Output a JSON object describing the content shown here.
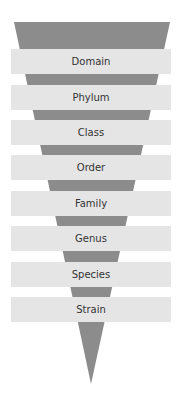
{
  "diagram": {
    "type": "taxonomy-funnel",
    "colors": {
      "funnel": "#8c8c8c",
      "bar": "#e5e5e5",
      "text": "#333333",
      "background": "#ffffff"
    },
    "levels": [
      {
        "label": "Domain"
      },
      {
        "label": "Phylum"
      },
      {
        "label": "Class"
      },
      {
        "label": "Order"
      },
      {
        "label": "Family"
      },
      {
        "label": "Genus"
      },
      {
        "label": "Species"
      },
      {
        "label": "Strain"
      }
    ]
  }
}
